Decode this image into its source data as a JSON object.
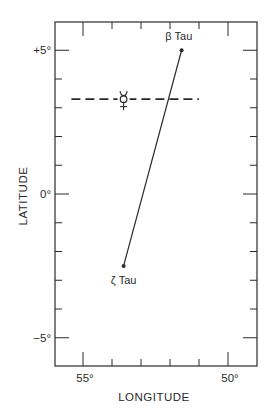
{
  "chart_data": {
    "type": "scatter",
    "title": "",
    "xlabel": "LONGITUDE",
    "ylabel": "LATITUDE",
    "xlim": [
      55.9,
      48.9
    ],
    "ylim": [
      -6.0,
      6.0
    ],
    "x_reversed": true,
    "grid": false,
    "x_ticks": [
      {
        "value": 55,
        "label": "55°",
        "major": true
      },
      {
        "value": 54,
        "label": "",
        "major": false
      },
      {
        "value": 53,
        "label": "",
        "major": false
      },
      {
        "value": 52,
        "label": "",
        "major": false
      },
      {
        "value": 51,
        "label": "",
        "major": false
      },
      {
        "value": 50,
        "label": "50°",
        "major": true
      }
    ],
    "y_ticks": [
      {
        "value": 5,
        "label": "+5°",
        "major": true
      },
      {
        "value": 4,
        "label": "",
        "major": false
      },
      {
        "value": 3,
        "label": "",
        "major": false
      },
      {
        "value": 2,
        "label": "",
        "major": false
      },
      {
        "value": 1,
        "label": "",
        "major": false
      },
      {
        "value": 0,
        "label": "0°",
        "major": true
      },
      {
        "value": -1,
        "label": "",
        "major": false
      },
      {
        "value": -2,
        "label": "",
        "major": false
      },
      {
        "value": -3,
        "label": "",
        "major": false
      },
      {
        "value": -4,
        "label": "",
        "major": false
      },
      {
        "value": -5,
        "label": "−5°",
        "major": true
      }
    ],
    "series": [
      {
        "name": "beta-zeta Tau line",
        "style": "solid",
        "points": [
          {
            "label": "ζ Tau",
            "x": 53.6,
            "y": -2.5
          },
          {
            "label": "β Tau",
            "x": 51.6,
            "y": 5.0
          }
        ]
      },
      {
        "name": "Mercury latitude",
        "style": "dashed",
        "points": [
          {
            "x": 55.4,
            "y": 3.3
          },
          {
            "x": 51.0,
            "y": 3.3
          }
        ]
      }
    ],
    "annotations": [
      {
        "text": "β Tau",
        "x": 51.7,
        "y": 5.35
      },
      {
        "text": "ζ Tau",
        "x": 53.6,
        "y": -3.0
      },
      {
        "text": "☿",
        "name": "Mercury symbol",
        "x": 53.6,
        "y": 3.3
      }
    ]
  },
  "labels": {
    "xlabel": "LONGITUDE",
    "ylabel": "LATITUDE",
    "beta": "β Tau",
    "zeta": "ζ Tau",
    "mercury": "☿"
  },
  "colors": {
    "ink": "#2a2a2a",
    "background": "#ffffff"
  }
}
